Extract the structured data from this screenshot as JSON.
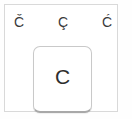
{
  "popup": {
    "name": "accent-variant-picker",
    "background_color": "#ffffff",
    "border_color": "#d9d9d9",
    "accent_options": [
      {
        "label": "Č",
        "name": "c-caron",
        "position": "left"
      },
      {
        "label": "Ç",
        "name": "c-cedilla",
        "position": "center"
      },
      {
        "label": "Ć",
        "name": "c-acute",
        "position": "right"
      }
    ]
  },
  "base_key": {
    "label": "C",
    "name": "key-c",
    "background_color": "#ffffff",
    "border_color": "#c9c9c9",
    "text_color": "#2e2e2e"
  }
}
